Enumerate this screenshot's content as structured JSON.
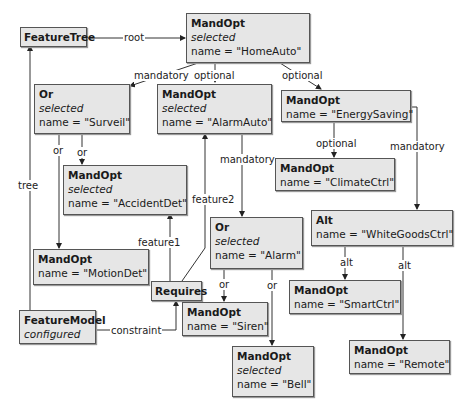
{
  "nodes": {
    "feature_tree": {
      "type": "FeatureTree"
    },
    "home_auto": {
      "type": "MandOpt",
      "state": "selected",
      "name": "name = \"HomeAuto\""
    },
    "surveil": {
      "type": "Or",
      "state": "selected",
      "name": "name = \"Surveil\""
    },
    "alarm_auto": {
      "type": "MandOpt",
      "state": "selected",
      "name": "name = \"AlarmAuto\""
    },
    "energy_saving": {
      "type": "MandOpt",
      "name": "name = \"EnergySaving\""
    },
    "accident_det": {
      "type": "MandOpt",
      "state": "selected",
      "name": "name = \"AccidentDet\""
    },
    "climate_ctrl": {
      "type": "MandOpt",
      "name": "name = \"ClimateCtrl\""
    },
    "alarm": {
      "type": "Or",
      "state": "selected",
      "name": "name = \"Alarm\""
    },
    "white_goods": {
      "type": "Alt",
      "name": "name = \"WhiteGoodsCtrl\""
    },
    "motion_det": {
      "type": "MandOpt",
      "name": "name = \"MotionDet\""
    },
    "requires": {
      "type": "Requires"
    },
    "feature_model": {
      "type": "FeatureModel",
      "state": "configured"
    },
    "siren": {
      "type": "MandOpt",
      "name": "name = \"Siren\""
    },
    "smart_ctrl": {
      "type": "MandOpt",
      "name": "name = \"SmartCtrl\""
    },
    "bell": {
      "type": "MandOpt",
      "state": "selected",
      "name": "name = \"Bell\""
    },
    "remote": {
      "type": "MandOpt",
      "name": "name = \"Remote\""
    }
  },
  "edges": {
    "root": "root",
    "tree": "tree",
    "home_surveil": "mandatory",
    "home_alarmauto": "optional",
    "home_energy": "optional",
    "surveil_motion": "or",
    "surveil_accident": "or",
    "alarmauto_alarm": "mandatory",
    "energy_climate": "optional",
    "energy_white": "mandatory",
    "requires_feature1": "feature1",
    "requires_feature2": "feature2",
    "model_constraint": "constraint",
    "alarm_siren": "or",
    "alarm_bell": "or",
    "white_smart": "alt",
    "white_remote": "alt"
  }
}
